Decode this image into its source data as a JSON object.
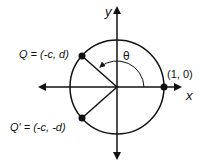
{
  "diagram": {
    "type": "unit-circle",
    "axes": {
      "x_label": "x",
      "y_label": "y"
    },
    "angle_label": "θ",
    "points": {
      "q": {
        "label": "Q = (-c, d)"
      },
      "q_prime": {
        "label": "Q' = (-c, -d)"
      },
      "unit": {
        "label": "(1, 0)"
      }
    },
    "colors": {
      "stroke": "#111111",
      "background": "#ffffff"
    }
  }
}
